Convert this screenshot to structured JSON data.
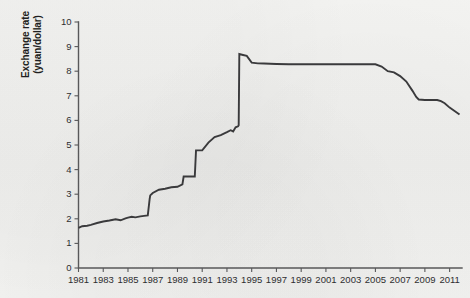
{
  "figure": {
    "background_color": "#f1f1ef",
    "ink_color": "#3a3a3c",
    "axis_color": "#58585a"
  },
  "chart_data": {
    "type": "line",
    "title": "",
    "xlabel": "",
    "ylabel": "Exchange rate (yuan/dollar)",
    "ylabel_line1": "Exchange rate",
    "ylabel_line2": "(yuan/dollar)",
    "xlim": [
      1981,
      2012
    ],
    "ylim": [
      0,
      10
    ],
    "ytick_step": 1,
    "xtick_step": 2,
    "grid": false,
    "legend": null,
    "yticks": [
      0,
      1,
      2,
      3,
      4,
      5,
      6,
      7,
      8,
      9,
      10
    ],
    "ytick_labels": [
      "0",
      "1",
      "2",
      "3",
      "4",
      "5",
      "6",
      "7",
      "8",
      "9",
      "10"
    ],
    "xticks": [
      1981,
      1983,
      1985,
      1987,
      1989,
      1991,
      1993,
      1995,
      1997,
      1999,
      2001,
      2003,
      2005,
      2007,
      2009,
      2011
    ],
    "xtick_labels": [
      "1981",
      "1983",
      "1985",
      "1987",
      "1989",
      "1991",
      "1993",
      "1995",
      "1997",
      "1999",
      "2001",
      "2003",
      "2005",
      "2007",
      "2009",
      "2011"
    ],
    "series": [
      {
        "name": "Yuan per US dollar",
        "x": [
          1981.0,
          1981.3,
          1981.7,
          1982.0,
          1982.5,
          1983.0,
          1983.5,
          1984.0,
          1984.4,
          1984.8,
          1985.0,
          1985.3,
          1985.6,
          1986.0,
          1986.3,
          1986.6,
          1986.75,
          1986.8,
          1987.0,
          1987.5,
          1988.0,
          1988.5,
          1989.0,
          1989.4,
          1989.5,
          1990.0,
          1990.4,
          1990.5,
          1991.0,
          1991.5,
          1992.0,
          1992.5,
          1993.0,
          1993.3,
          1993.5,
          1993.7,
          1993.9,
          1993.95,
          1994.0,
          1994.3,
          1994.6,
          1995.0,
          1995.5,
          1996.0,
          1996.5,
          1997.0,
          1998.0,
          1999.0,
          2000.0,
          2001.0,
          2002.0,
          2003.0,
          2004.0,
          2005.0,
          2005.5,
          2006.0,
          2006.5,
          2007.0,
          2007.5,
          2008.0,
          2008.3,
          2008.5,
          2009.0,
          2009.5,
          2010.0,
          2010.3,
          2010.6,
          2011.0,
          2011.4,
          2011.8
        ],
        "y": [
          1.63,
          1.7,
          1.72,
          1.75,
          1.83,
          1.89,
          1.93,
          1.98,
          1.94,
          2.02,
          2.05,
          2.08,
          2.06,
          2.1,
          2.12,
          2.14,
          2.8,
          2.95,
          3.05,
          3.18,
          3.22,
          3.28,
          3.3,
          3.4,
          3.72,
          3.72,
          3.72,
          4.78,
          4.78,
          5.1,
          5.32,
          5.4,
          5.52,
          5.6,
          5.55,
          5.72,
          5.76,
          5.8,
          8.7,
          8.66,
          8.62,
          8.35,
          8.32,
          8.31,
          8.3,
          8.29,
          8.28,
          8.28,
          8.28,
          8.28,
          8.28,
          8.28,
          8.28,
          8.28,
          8.19,
          8.0,
          7.95,
          7.8,
          7.58,
          7.2,
          6.95,
          6.85,
          6.83,
          6.83,
          6.83,
          6.78,
          6.7,
          6.52,
          6.38,
          6.24
        ]
      }
    ]
  }
}
